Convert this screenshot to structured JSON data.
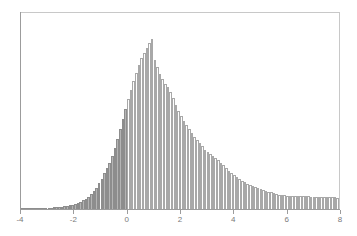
{
  "figure": {
    "background_color": "#ffffff",
    "frame_color": "#c8c8c8",
    "axis_color": "#9c9c9c",
    "tick_label_color": "#7a7a7a"
  },
  "chart_data": {
    "type": "bar",
    "subtype": "histogram",
    "title": "",
    "subtitle": "",
    "xlabel": "",
    "ylabel": "",
    "xlim": [
      -4,
      8
    ],
    "ylim": [
      0,
      1
    ],
    "grid": false,
    "legend": null,
    "bin_width": 0.1,
    "xticks": [
      -4,
      -2,
      0,
      2,
      4,
      6,
      8
    ],
    "xtick_labels": [
      "-4",
      "-2",
      "0",
      "2",
      "4",
      "6",
      "8"
    ],
    "yticks": [],
    "ytick_labels": [],
    "annotations": [],
    "series": [
      {
        "name": "below-zero",
        "fill_color": "#b4b4b4",
        "edge_color": "#8d8d8d",
        "range": [
          -4,
          0
        ]
      },
      {
        "name": "above-zero",
        "fill_color": "#ffffff",
        "edge_color": "#a8a8a8",
        "range": [
          0,
          8
        ]
      }
    ],
    "bin_edges_start": -4,
    "values": [
      0.002,
      0.002,
      0.002,
      0.003,
      0.003,
      0.004,
      0.004,
      0.005,
      0.005,
      0.006,
      0.007,
      0.008,
      0.009,
      0.01,
      0.012,
      0.014,
      0.016,
      0.019,
      0.022,
      0.026,
      0.031,
      0.037,
      0.043,
      0.051,
      0.06,
      0.072,
      0.086,
      0.104,
      0.124,
      0.148,
      0.176,
      0.206,
      0.236,
      0.268,
      0.306,
      0.352,
      0.404,
      0.462,
      0.52,
      0.578,
      0.634,
      0.688,
      0.742,
      0.79,
      0.836,
      0.872,
      0.904,
      0.934,
      0.96,
      0.984,
      0.862,
      0.822,
      0.784,
      0.75,
      0.726,
      0.704,
      0.676,
      0.642,
      0.604,
      0.566,
      0.536,
      0.512,
      0.488,
      0.464,
      0.44,
      0.418,
      0.398,
      0.38,
      0.362,
      0.344,
      0.33,
      0.318,
      0.306,
      0.294,
      0.282,
      0.268,
      0.252,
      0.236,
      0.22,
      0.206,
      0.194,
      0.184,
      0.174,
      0.164,
      0.154,
      0.146,
      0.138,
      0.132,
      0.126,
      0.12,
      0.114,
      0.108,
      0.104,
      0.1,
      0.096,
      0.092,
      0.088,
      0.084,
      0.082,
      0.08,
      0.078,
      0.077,
      0.076,
      0.075,
      0.075,
      0.074,
      0.074,
      0.073,
      0.073,
      0.072,
      0.072,
      0.071,
      0.071,
      0.07,
      0.07,
      0.069,
      0.068,
      0.068,
      0.067,
      0.066,
      0.066,
      0.066,
      0.066,
      0.066,
      0.066,
      0.065,
      0.064,
      0.063,
      0.062,
      0.06,
      0.058,
      0.056,
      0.054,
      0.052,
      0.05,
      0.048,
      0.046,
      0.045,
      0.044,
      0.043,
      0.042,
      0.041,
      0.04,
      0.039,
      0.038,
      0.037,
      0.036,
      0.035,
      0.034,
      0.033,
      0.032,
      0.031,
      0.03,
      0.029,
      0.028,
      0.027,
      0.026,
      0.025,
      0.024,
      0.023,
      0.022,
      0.021,
      0.02,
      0.019,
      0.018,
      0.018,
      0.017,
      0.017,
      0.016,
      0.015,
      0.015,
      0.014,
      0.014,
      0.013,
      0.013,
      0.012,
      0.012,
      0.011,
      0.011,
      0.01,
      0.01,
      0.009,
      0.009,
      0.008,
      0.008,
      0.007,
      0.007,
      0.007,
      0.006,
      0.006,
      0.006,
      0.005,
      0.005,
      0.005,
      0.004,
      0.004,
      0.004,
      0.004,
      0.003,
      0.003
    ]
  }
}
